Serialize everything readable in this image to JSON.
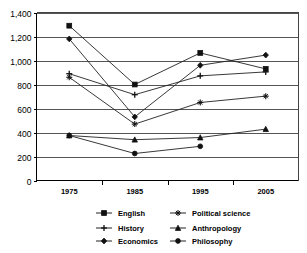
{
  "chart_data": {
    "type": "line",
    "title": "",
    "xlabel": "",
    "ylabel": "",
    "categories": [
      "1975",
      "1985",
      "1995",
      "2005"
    ],
    "x": [
      1975,
      1985,
      1995,
      2005
    ],
    "ylim": [
      0,
      1400
    ],
    "ytick_values": [
      0,
      200,
      400,
      600,
      800,
      1000,
      1200,
      1400
    ],
    "ytick_labels": [
      "0",
      "200",
      "400",
      "600",
      "800",
      "1,000",
      "1,200",
      "1,400"
    ],
    "grid": true,
    "legend_position": "bottom",
    "series": [
      {
        "name": "English",
        "marker": "square",
        "values": [
          1290,
          800,
          1063,
          930
        ]
      },
      {
        "name": "Political science",
        "marker": "star",
        "values": [
          860,
          470,
          650,
          703
        ]
      },
      {
        "name": "History",
        "marker": "plus",
        "values": [
          890,
          715,
          872,
          905
        ]
      },
      {
        "name": "Anthropology",
        "marker": "triangle",
        "values": [
          375,
          340,
          358,
          428
        ]
      },
      {
        "name": "Economics",
        "marker": "diamond",
        "values": [
          1180,
          530,
          960,
          1045
        ]
      },
      {
        "name": "Philosophy",
        "marker": "circle",
        "values": [
          375,
          225,
          285,
          null
        ]
      }
    ]
  },
  "legend": {
    "entries": [
      {
        "label": "English",
        "marker": "square"
      },
      {
        "label": "Political science",
        "marker": "star"
      },
      {
        "label": "History",
        "marker": "plus"
      },
      {
        "label": "Anthropology",
        "marker": "triangle"
      },
      {
        "label": "Economics",
        "marker": "diamond"
      },
      {
        "label": "Philosophy",
        "marker": "circle"
      }
    ]
  },
  "colors": {
    "line": "#222222",
    "marker": "#111111",
    "grid": "#555555",
    "axis": "#000000",
    "background": "#ffffff"
  }
}
